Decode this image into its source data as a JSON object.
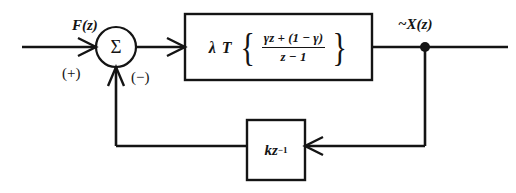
{
  "diagram": {
    "background_color": "#ffffff",
    "line_color": "#141414",
    "input": {
      "label": "F(z)"
    },
    "output": {
      "label": "~X(z)"
    },
    "summer": {
      "symbol": "Σ",
      "positive_sign": "(+)",
      "negative_sign": "(−)"
    },
    "forward_block": {
      "gain": "λ T",
      "open_brace": "{",
      "close_brace": "}",
      "numerator": "γz + (1 − γ)",
      "denominator": "z − 1"
    },
    "feedback_block": {
      "gain": "kz",
      "exponent": "−1"
    }
  }
}
